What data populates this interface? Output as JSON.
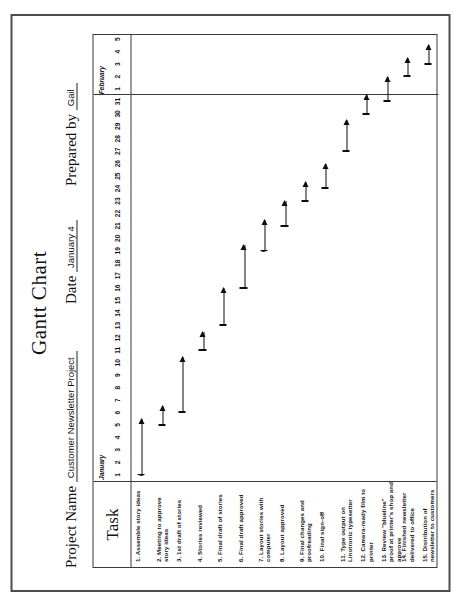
{
  "document": {
    "title": "Gantt Chart",
    "fields": [
      {
        "label": "Project Name",
        "value": "Customer Newsletter Project"
      },
      {
        "label": "Date",
        "value": "January 4"
      },
      {
        "label": "Prepared by",
        "value": "Gail"
      }
    ],
    "task_column_header": "Task"
  },
  "chart_data": {
    "type": "bar",
    "title": "Gantt Chart",
    "xlabel": "",
    "ylabel": "Task",
    "orientation": "horizontal",
    "grid": false,
    "legend": false,
    "axis_months": [
      {
        "name": "January",
        "start_day": 1,
        "end_day": 31
      },
      {
        "name": "February",
        "start_day": 1,
        "end_day": 5
      }
    ],
    "axis_tick_labels": [
      "1",
      "2",
      "3",
      "4",
      "5",
      "6",
      "7",
      "8",
      "9",
      "10",
      "11",
      "12",
      "13",
      "14",
      "15",
      "16",
      "17",
      "18",
      "19",
      "20",
      "21",
      "22",
      "23",
      "24",
      "25",
      "26",
      "27",
      "28",
      "29",
      "30",
      "31",
      "1",
      "2",
      "3",
      "4",
      "5"
    ],
    "xlim": [
      1,
      36
    ],
    "categories": [
      "1. Assemble story ideas",
      "2. Meeting to approve story ideas",
      "3. 1st draft of stories",
      "4. Stories reviewed",
      "5. Final draft of stories",
      "6. Final draft approved",
      "7. Layout stories with computer",
      "8. Layout approved",
      "9. Final changes and proofreading",
      "10. Final sign-off",
      "11. Type output on Linotronic typesetter",
      "12. Camera-ready film to printer",
      "13. Review \"blueline\" proof at printer's shop and approve",
      "14. Finished newsletter delivered to office",
      "15. Distribution of newsletter to customers"
    ],
    "series": [
      {
        "name": "Task duration (days)",
        "bars": [
          {
            "task": "1. Assemble story ideas",
            "start": 1,
            "end": 5.5,
            "duration": 4.5
          },
          {
            "task": "2. Meeting to approve story ideas",
            "start": 5,
            "end": 6.5,
            "duration": 1.5
          },
          {
            "task": "3. 1st draft of stories",
            "start": 6,
            "end": 10.5,
            "duration": 4.5
          },
          {
            "task": "4. Stories reviewed",
            "start": 11,
            "end": 12.5,
            "duration": 1.5
          },
          {
            "task": "5. Final draft of stories",
            "start": 13,
            "end": 16,
            "duration": 3.0
          },
          {
            "task": "6. Final draft approved",
            "start": 16,
            "end": 19.5,
            "duration": 3.5
          },
          {
            "task": "7. Layout stories with computer",
            "start": 19,
            "end": 21.5,
            "duration": 2.5
          },
          {
            "task": "8. Layout approved",
            "start": 21,
            "end": 23,
            "duration": 2.0
          },
          {
            "task": "9. Final changes and proofreading",
            "start": 23,
            "end": 24.5,
            "duration": 1.5
          },
          {
            "task": "10. Final sign-off",
            "start": 24,
            "end": 26,
            "duration": 2.0
          },
          {
            "task": "11. Type output on Linotronic typesetter",
            "start": 27,
            "end": 29.5,
            "duration": 2.5
          },
          {
            "task": "12. Camera-ready film to printer",
            "start": 30,
            "end": 31.5,
            "duration": 1.5
          },
          {
            "task": "13. Review \"blueline\" proof at printer's shop and approve",
            "start": 31,
            "end": 33,
            "duration": 2.0
          },
          {
            "task": "14. Finished newsletter delivered to office",
            "start": 33,
            "end": 34.5,
            "duration": 1.5
          },
          {
            "task": "15. Distribution of newsletter to customers",
            "start": 34,
            "end": 35.5,
            "duration": 1.5
          }
        ]
      }
    ],
    "bar_style": "line-with-arrowhead",
    "colors": {
      "bar": "#0d0d0d",
      "border": "#3a3a3a",
      "page_border": "#4c4c4c",
      "paper": "#ffffff"
    }
  }
}
